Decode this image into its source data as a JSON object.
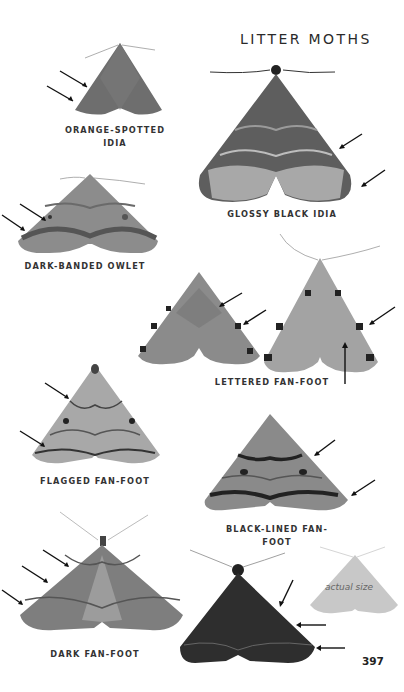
{
  "page": {
    "title": "LITTER MOTHS",
    "page_number": "397",
    "actual_size_label": "actual size"
  },
  "species": [
    {
      "name_line1": "ORANGE-SPOTTED",
      "name_line2": "IDIA",
      "arrows": 2
    },
    {
      "name": "GLOSSY BLACK IDIA",
      "arrows": 2
    },
    {
      "name": "DARK-BANDED OWLET",
      "arrows": 2
    },
    {
      "name": "LETTERED FAN-FOOT",
      "arrows": 3,
      "specimens": 2
    },
    {
      "name": "FLAGGED FAN-FOOT",
      "arrows": 2
    },
    {
      "name": "BLACK-LINED FAN-FOOT",
      "arrows": 2
    },
    {
      "name": "DARK FAN-FOOT",
      "arrows": 3
    },
    {
      "name": "DARK FAN-FOOT (dark form)",
      "arrows": 3
    }
  ],
  "colors": {
    "text": "#2a2a2a",
    "moth_gray": "#8a8a8a",
    "moth_dark": "#2e2e2e",
    "actual_size_silhouette": "#c8c8c8"
  }
}
